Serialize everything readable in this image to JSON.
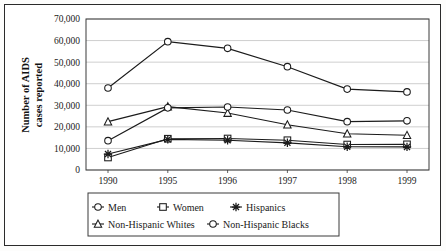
{
  "chart_data": {
    "type": "line",
    "title": "",
    "xlabel": "",
    "ylabel": "Number of AIDS cases reported",
    "ylabel_line1": "Number of AIDS",
    "ylabel_line2": "cases reported",
    "categories": [
      "1990",
      "1995",
      "1996",
      "1997",
      "1998",
      "1999"
    ],
    "ylim": [
      0,
      70000
    ],
    "ytick_values": [
      0,
      10000,
      20000,
      30000,
      40000,
      50000,
      60000,
      70000
    ],
    "ytick_labels": [
      "0",
      "10,000",
      "20,000",
      "30,000",
      "40,000",
      "50,000",
      "60,000",
      "70,000"
    ],
    "grid": true,
    "legend_position": "bottom",
    "series": [
      {
        "name": "Men",
        "marker": "circle",
        "values": [
          38000,
          59500,
          56400,
          47900,
          37500,
          36200
        ]
      },
      {
        "name": "Women",
        "marker": "square",
        "values": [
          5800,
          14500,
          14600,
          13800,
          11800,
          11900
        ]
      },
      {
        "name": "Hispanics",
        "marker": "star",
        "values": [
          7400,
          14200,
          13800,
          12600,
          10800,
          10700
        ]
      },
      {
        "name": "Non-Hispanic Whites",
        "marker": "triangle",
        "values": [
          22400,
          29400,
          26400,
          21000,
          16800,
          16100
        ]
      },
      {
        "name": "Non-Hispanic Blacks",
        "marker": "circle",
        "values": [
          13600,
          28800,
          29200,
          27800,
          22400,
          22800
        ]
      }
    ]
  },
  "colors": {
    "line": "#1b1b1b",
    "grid": "#b9b9b9",
    "frame": "#3a3a3a",
    "text": "#1a1a1a",
    "background": "#ffffff"
  },
  "legend": {
    "items": [
      {
        "label": "Men",
        "marker": "circle"
      },
      {
        "label": "Women",
        "marker": "square"
      },
      {
        "label": "Hispanics",
        "marker": "star"
      },
      {
        "label": "Non-Hispanic Whites",
        "marker": "triangle"
      },
      {
        "label": "Non-Hispanic Blacks",
        "marker": "circle"
      }
    ]
  }
}
